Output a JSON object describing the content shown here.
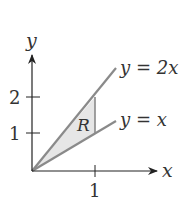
{
  "diagram": {
    "axes": {
      "x_label": "x",
      "y_label": "y",
      "x_ticks": [
        {
          "value": 1,
          "label": "1"
        }
      ],
      "y_ticks": [
        {
          "value": 1,
          "label": "1"
        },
        {
          "value": 2,
          "label": "2"
        }
      ]
    },
    "curves": [
      {
        "name": "upper-line",
        "label": "y = 2x",
        "slope": 2
      },
      {
        "name": "lower-line",
        "label": "y = x",
        "slope": 1
      }
    ],
    "region": {
      "label": "R",
      "description": "Triangle bounded by y = x, y = 2x, and x = 1",
      "vertices": [
        [
          0,
          0
        ],
        [
          1,
          1
        ],
        [
          1,
          2
        ]
      ]
    },
    "colors": {
      "axis": "#222222",
      "line": "#8a8a8a",
      "fill": "#e6e6e6",
      "text": "#333333"
    }
  }
}
